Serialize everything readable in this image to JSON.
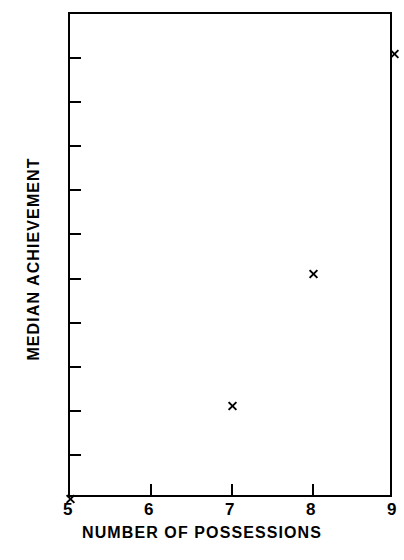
{
  "chart_data": {
    "type": "scatter",
    "title": "BLACK",
    "xlabel": "NUMBER OF POSSESSIONS",
    "ylabel": "MEDIAN ACHIEVEMENT",
    "xlim": [
      5,
      9
    ],
    "ylim": [
      20,
      31
    ],
    "xticks": [
      "5",
      "6",
      "7",
      "8",
      "9"
    ],
    "yticks": [
      "20",
      "21",
      "22",
      "23",
      "24",
      "25",
      "26",
      "27",
      "28",
      "29",
      "30",
      "31"
    ],
    "grid": false,
    "legend": false,
    "marker": "x",
    "color": "#000000",
    "x": [
      5,
      7,
      8,
      9
    ],
    "y": [
      20.0,
      22.1,
      25.1,
      30.1
    ],
    "points": [
      {
        "x": 5,
        "y": 20.0
      },
      {
        "x": 7,
        "y": 22.1
      },
      {
        "x": 8,
        "y": 25.1
      },
      {
        "x": 9,
        "y": 30.1
      }
    ]
  }
}
